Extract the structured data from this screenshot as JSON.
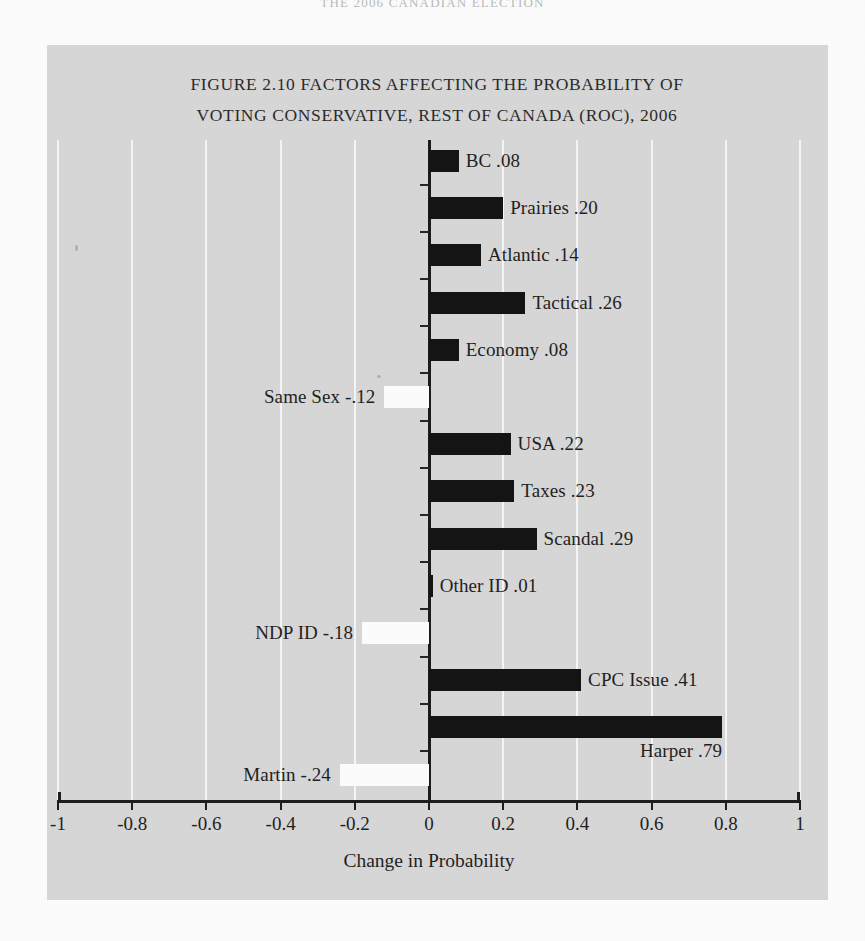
{
  "page": {
    "running_header": "THE 2006 CANADIAN ELECTION"
  },
  "chart_data": {
    "type": "bar",
    "orientation": "horizontal",
    "title_line1": "FIGURE 2.10 FACTORS AFFECTING THE PROBABILITY OF",
    "title_line2": "VOTING CONSERVATIVE, REST OF CANADA (ROC), 2006",
    "xlabel": "Change in Probability",
    "ylabel": "",
    "xlim": [
      -1,
      1
    ],
    "xticks": [
      -1,
      -0.8,
      -0.6,
      -0.4,
      -0.2,
      0,
      0.2,
      0.4,
      0.6,
      0.8,
      1
    ],
    "xtick_labels": [
      "-1",
      "-0.8",
      "-0.6",
      "-0.4",
      "-0.2",
      "0",
      "0.2",
      "0.4",
      "0.6",
      "0.8",
      "1"
    ],
    "grid": "vertical",
    "legend": "none",
    "colors": {
      "panel_background": "#d4d4d4",
      "positive_bar": "#141414",
      "negative_bar": "#fbfbfb",
      "gridline": "#f4f4f4",
      "axis": "#1d1d1d"
    },
    "categories": [
      "BC",
      "Prairies",
      "Atlantic",
      "Tactical",
      "Economy",
      "Same Sex",
      "USA",
      "Taxes",
      "Scandal",
      "Other ID",
      "NDP ID",
      "CPC Issue",
      "Harper",
      "Martin"
    ],
    "values": [
      0.08,
      0.2,
      0.14,
      0.26,
      0.08,
      -0.12,
      0.22,
      0.23,
      0.29,
      0.01,
      -0.18,
      0.41,
      0.79,
      -0.24
    ],
    "bars": [
      {
        "label": "BC",
        "value": 0.08,
        "display": "BC .08",
        "label_side": "right"
      },
      {
        "label": "Prairies",
        "value": 0.2,
        "display": "Prairies .20",
        "label_side": "right"
      },
      {
        "label": "Atlantic",
        "value": 0.14,
        "display": "Atlantic .14",
        "label_side": "right"
      },
      {
        "label": "Tactical",
        "value": 0.26,
        "display": "Tactical .26",
        "label_side": "right"
      },
      {
        "label": "Economy",
        "value": 0.08,
        "display": "Economy .08",
        "label_side": "right"
      },
      {
        "label": "Same Sex",
        "value": -0.12,
        "display": "Same Sex -.12",
        "label_side": "left"
      },
      {
        "label": "USA",
        "value": 0.22,
        "display": "USA .22",
        "label_side": "right"
      },
      {
        "label": "Taxes",
        "value": 0.23,
        "display": "Taxes .23",
        "label_side": "right"
      },
      {
        "label": "Scandal",
        "value": 0.29,
        "display": "Scandal .29",
        "label_side": "right"
      },
      {
        "label": "Other ID",
        "value": 0.01,
        "display": "Other ID .01",
        "label_side": "right"
      },
      {
        "label": "NDP ID",
        "value": -0.18,
        "display": "NDP ID -.18",
        "label_side": "left"
      },
      {
        "label": "CPC Issue",
        "value": 0.41,
        "display": "CPC Issue .41",
        "label_side": "right"
      },
      {
        "label": "Harper",
        "value": 0.79,
        "display": "Harper .79",
        "label_side": "right-below"
      },
      {
        "label": "Martin",
        "value": -0.24,
        "display": "Martin -.24",
        "label_side": "left"
      }
    ]
  }
}
